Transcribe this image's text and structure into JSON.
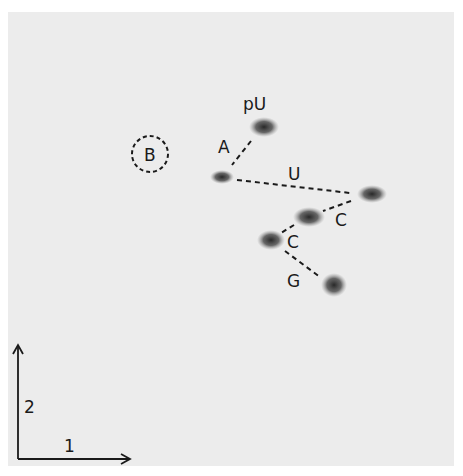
{
  "figure": {
    "background_color": "#ececec",
    "spot_color": "#2a2a2a",
    "labels": {
      "pU": "pU",
      "A": "A",
      "U": "U",
      "C1": "C",
      "C2": "C",
      "G": "G",
      "B": "B"
    },
    "axes": {
      "dimension_1": "1",
      "dimension_2": "2"
    },
    "spots": [
      {
        "id": "pU",
        "x": 264,
        "y": 127,
        "rx": 14,
        "ry": 9
      },
      {
        "id": "A",
        "x": 222,
        "y": 177,
        "rx": 11,
        "ry": 6
      },
      {
        "id": "U",
        "x": 372,
        "y": 194,
        "rx": 14,
        "ry": 8
      },
      {
        "id": "C1",
        "x": 309,
        "y": 217,
        "rx": 15,
        "ry": 9
      },
      {
        "id": "C2",
        "x": 271,
        "y": 240,
        "rx": 13,
        "ry": 9
      },
      {
        "id": "G",
        "x": 334,
        "y": 285,
        "rx": 12,
        "ry": 11
      }
    ]
  }
}
